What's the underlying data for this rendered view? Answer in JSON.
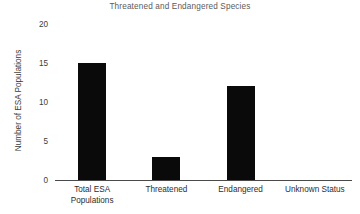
{
  "chart_data": {
    "type": "bar",
    "title": "Threatened and Endangered Species",
    "xlabel": "",
    "ylabel": "Number of ESA Populations",
    "categories": [
      "Total ESA Populations",
      "Threatened",
      "Endangered",
      "Unknown Status"
    ],
    "category_lines": [
      [
        "Total ESA",
        "Populations"
      ],
      [
        "Threatened"
      ],
      [
        "Endangered"
      ],
      [
        "Unknown Status"
      ]
    ],
    "values": [
      15,
      3,
      12,
      0
    ],
    "ylim": [
      0,
      20
    ],
    "yticks": [
      0,
      5,
      10,
      15,
      20
    ],
    "ytick_labels": [
      "0",
      "5",
      "10",
      "15",
      "20"
    ],
    "grid": false,
    "legend": false,
    "bar_color": "#0a0a0a",
    "title_color": "#5b5b5b",
    "axis_color": "#4a4a4a",
    "label_color": "#2e2e2e"
  }
}
